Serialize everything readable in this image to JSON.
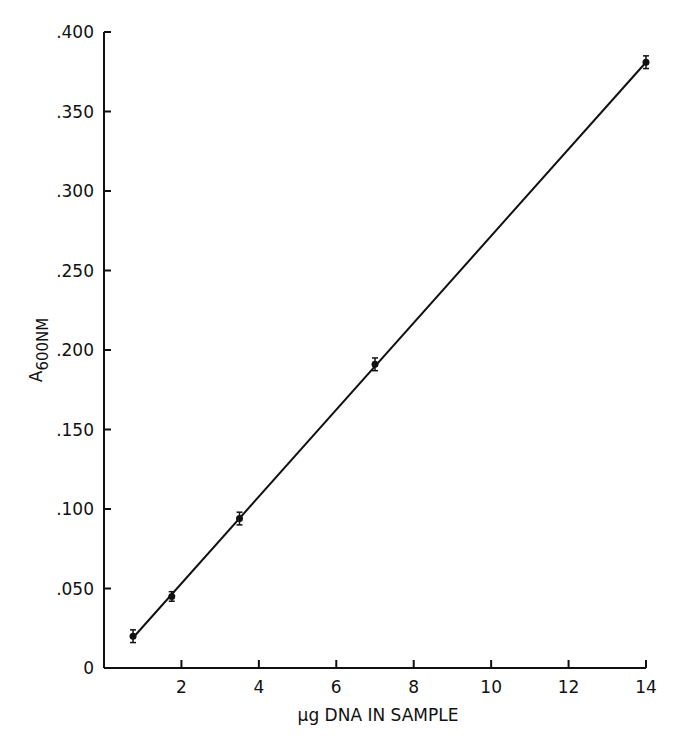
{
  "chart_data": {
    "type": "scatter",
    "title": "",
    "xlabel": "µg DNA IN SAMPLE",
    "ylabel": "A600NM",
    "ylabel_main": "A",
    "ylabel_sub": "600NM",
    "xlim": [
      0,
      14
    ],
    "ylim": [
      0,
      0.4
    ],
    "x_ticks": [
      2,
      4,
      6,
      8,
      10,
      12,
      14
    ],
    "x_tick_labels": [
      "2",
      "4",
      "6",
      "8",
      "10",
      "12",
      "14"
    ],
    "y_ticks": [
      0,
      0.05,
      0.1,
      0.15,
      0.2,
      0.25,
      0.3,
      0.35,
      0.4
    ],
    "y_tick_labels": [
      "0",
      ".050",
      ".100",
      ".150",
      ".200",
      ".250",
      ".300",
      ".350",
      ".400"
    ],
    "grid": false,
    "legend": null,
    "series": [
      {
        "name": "A600 vs DNA",
        "x": [
          0.75,
          1.75,
          3.5,
          7,
          14
        ],
        "y": [
          0.02,
          0.045,
          0.094,
          0.191,
          0.381
        ],
        "error": [
          0.004,
          0.003,
          0.004,
          0.004,
          0.004
        ],
        "marker": "filled-circle",
        "error_bars": true
      }
    ],
    "fit_line": {
      "type": "linear",
      "from": [
        0.75,
        0.019
      ],
      "to": [
        14,
        0.381
      ]
    }
  }
}
